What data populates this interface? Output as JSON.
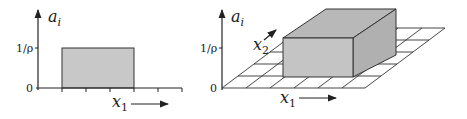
{
  "left_plot": {
    "y_axis_label": "a",
    "y_axis_sub": "i",
    "y_tick_top": "1/ρ",
    "y_tick_zero": "0",
    "x_axis_label": "x",
    "x_axis_sub": "1",
    "box_fill": "#c8c8c8"
  },
  "right_plot": {
    "y_axis_label": "a",
    "y_axis_sub": "i",
    "y_tick_top": "1/ρ",
    "y_tick_zero": "0",
    "x1_label": "x",
    "x1_sub": "1",
    "x2_label": "x",
    "x2_sub": "2",
    "box_front_fill": "#c4c4c4",
    "box_top_fill": "#b8b8b8",
    "box_side_fill": "#b0b0b0"
  }
}
